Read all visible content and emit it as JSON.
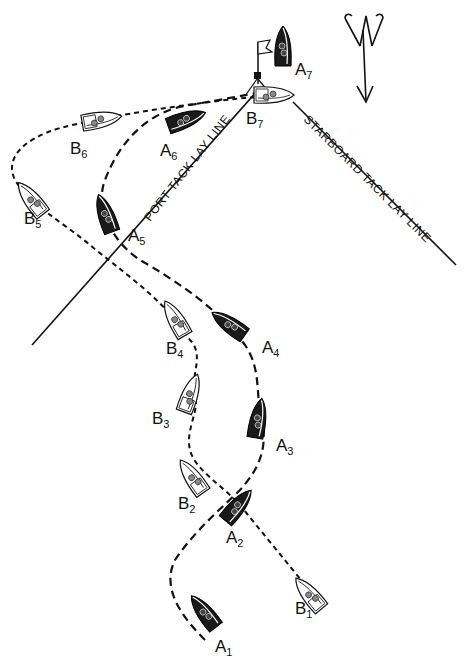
{
  "diagram": {
    "lay_lines": {
      "port": "PORT TACK LAY LINE",
      "starboard": "STARBOARD TACK LAY LINE"
    },
    "wind_arrow": "wind-direction-arrow",
    "mark": "flag-buoy",
    "boats_a": [
      {
        "letter": "A",
        "sub": "1"
      },
      {
        "letter": "A",
        "sub": "2"
      },
      {
        "letter": "A",
        "sub": "3"
      },
      {
        "letter": "A",
        "sub": "4"
      },
      {
        "letter": "A",
        "sub": "5"
      },
      {
        "letter": "A",
        "sub": "6"
      },
      {
        "letter": "A",
        "sub": "7"
      }
    ],
    "boats_b": [
      {
        "letter": "B",
        "sub": "1"
      },
      {
        "letter": "B",
        "sub": "2"
      },
      {
        "letter": "B",
        "sub": "3"
      },
      {
        "letter": "B",
        "sub": "4"
      },
      {
        "letter": "B",
        "sub": "5"
      },
      {
        "letter": "B",
        "sub": "6"
      },
      {
        "letter": "B",
        "sub": "7"
      }
    ]
  }
}
